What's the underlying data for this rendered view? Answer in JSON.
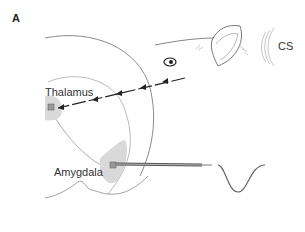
{
  "figure": {
    "panel_label": "A",
    "labels": {
      "thalamus": "Thalamus",
      "amygdala": "Amygdala",
      "stimulus": "CS"
    },
    "colors": {
      "outline": "#8a8a8a",
      "region_fill": "#d9d9d9",
      "arrow": "#222222",
      "waveform": "#666666"
    },
    "icons": [
      "eye-icon",
      "ear-icon",
      "sound-waves-icon",
      "electrode-icon",
      "waveform-icon"
    ]
  }
}
